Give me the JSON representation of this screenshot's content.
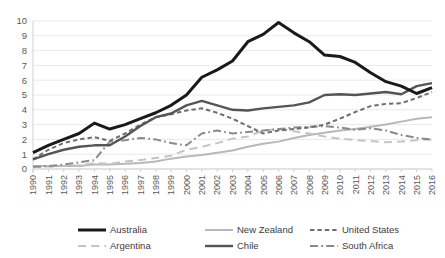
{
  "chart_data": {
    "type": "line",
    "title": "",
    "subtitle": "",
    "xlabel": "",
    "ylabel": "",
    "grid": true,
    "legend_position": "bottom",
    "ylim": [
      0,
      10
    ],
    "yticks": [
      0,
      1,
      2,
      3,
      4,
      5,
      6,
      7,
      8,
      9,
      10
    ],
    "categories": [
      "1990",
      "1991",
      "1992",
      "1993",
      "1994",
      "1995",
      "1996",
      "1997",
      "1998",
      "1999",
      "2000",
      "2001",
      "2002",
      "2003",
      "2004",
      "2005",
      "2006",
      "2007",
      "2008",
      "2009",
      "2010",
      "2011",
      "2012",
      "2013",
      "2014",
      "2015",
      "2016"
    ],
    "series": [
      {
        "name": "Australia",
        "color": "#1a1a1a",
        "style": "solid",
        "width": 3.0,
        "values": [
          1.1,
          1.6,
          2.0,
          2.4,
          3.1,
          2.7,
          3.0,
          3.4,
          3.8,
          4.3,
          5.0,
          6.2,
          6.7,
          7.3,
          8.6,
          9.1,
          9.9,
          9.2,
          8.6,
          7.7,
          7.6,
          7.2,
          6.5,
          5.9,
          5.6,
          5.1,
          5.5
        ]
      },
      {
        "name": "New Zealand",
        "color": "#b8b8b8",
        "style": "solid",
        "width": 2.0,
        "values": [
          0.2,
          0.2,
          0.2,
          0.2,
          0.3,
          0.3,
          0.35,
          0.4,
          0.5,
          0.7,
          0.85,
          0.95,
          1.1,
          1.25,
          1.5,
          1.7,
          1.85,
          2.1,
          2.3,
          2.45,
          2.6,
          2.7,
          2.85,
          3.0,
          3.2,
          3.4,
          3.5
        ]
      },
      {
        "name": "United States",
        "color": "#6e6e6e",
        "style": "dashed",
        "width": 2.0,
        "values": [
          0.65,
          1.3,
          1.75,
          2.0,
          2.15,
          1.9,
          2.4,
          3.0,
          3.5,
          3.7,
          3.95,
          4.1,
          3.8,
          3.4,
          2.9,
          2.4,
          2.6,
          2.7,
          2.8,
          3.0,
          3.4,
          3.85,
          4.25,
          4.4,
          4.45,
          4.8,
          5.2
        ]
      },
      {
        "name": "Argentina",
        "color": "#c4c4c4",
        "style": "longdash",
        "width": 2.0,
        "values": [
          0.15,
          0.15,
          0.2,
          0.25,
          0.4,
          0.35,
          0.5,
          0.6,
          0.75,
          0.9,
          1.3,
          1.5,
          1.75,
          2.05,
          2.2,
          2.6,
          2.7,
          2.55,
          2.4,
          2.2,
          2.05,
          1.95,
          1.9,
          1.8,
          1.85,
          1.95,
          2.0
        ]
      },
      {
        "name": "Chile",
        "color": "#555555",
        "style": "solid",
        "width": 2.4,
        "values": [
          0.65,
          1.0,
          1.3,
          1.5,
          1.6,
          1.6,
          2.2,
          2.9,
          3.5,
          3.75,
          4.3,
          4.6,
          4.3,
          4.0,
          3.95,
          4.1,
          4.2,
          4.3,
          4.5,
          5.0,
          5.05,
          5.0,
          5.1,
          5.2,
          5.05,
          5.6,
          5.8
        ]
      },
      {
        "name": "South Africa",
        "color": "#8a8a8a",
        "style": "dashdot",
        "width": 2.0,
        "values": [
          0.15,
          0.2,
          0.3,
          0.45,
          0.6,
          1.85,
          1.95,
          2.1,
          2.0,
          1.75,
          1.6,
          2.4,
          2.6,
          2.4,
          2.5,
          2.6,
          2.7,
          2.8,
          2.85,
          2.9,
          2.8,
          2.65,
          2.75,
          2.6,
          2.3,
          2.1,
          2.0
        ]
      }
    ]
  },
  "legend": {
    "items": [
      {
        "label": "Australia"
      },
      {
        "label": "New Zealand"
      },
      {
        "label": "United States"
      },
      {
        "label": "Argentina"
      },
      {
        "label": "Chile"
      },
      {
        "label": "South Africa"
      }
    ]
  }
}
